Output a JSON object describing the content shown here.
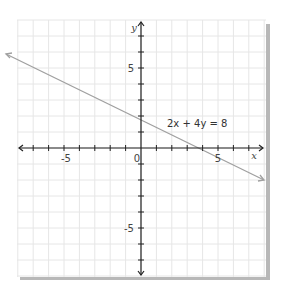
{
  "chart_data": {
    "type": "line",
    "title": "",
    "xlabel": "x",
    "ylabel": "y",
    "xlim": [
      -8,
      8
    ],
    "ylim": [
      -8,
      8
    ],
    "grid": true,
    "x_ticks_labeled": [
      -5,
      0,
      5
    ],
    "y_ticks_labeled": [
      5,
      -5
    ],
    "tick_labels": {
      "x_neg": "-5",
      "origin": "0",
      "x_pos": "5",
      "y_pos": "5",
      "y_neg": "-5"
    },
    "series": [
      {
        "name": "2x + 4y = 8",
        "equation": "2x + 4y = 8",
        "slope": -0.5,
        "intercept": 2,
        "x": [
          -8.8,
          -4,
          0,
          4,
          8
        ],
        "y": [
          6.4,
          4,
          2,
          0,
          -2
        ],
        "arrows": "both",
        "color": "#a0a0a0"
      }
    ],
    "annotations": [
      {
        "text": "2x + 4y = 8",
        "x": 1.1,
        "y": 1.6
      }
    ],
    "colors": {
      "grid": "#e6e6e6",
      "axis": "#222222",
      "line": "#a0a0a0",
      "shadow": "#b5b5b5"
    }
  }
}
